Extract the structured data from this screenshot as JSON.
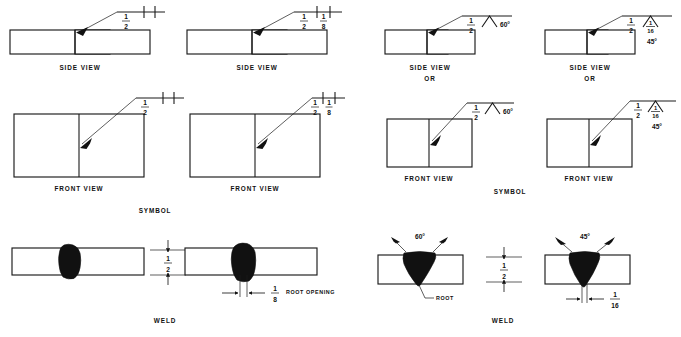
{
  "page": {
    "width": 681,
    "height": 337,
    "background": "#ffffff",
    "ink": "#111111"
  },
  "labels": {
    "side_view": "SIDE VIEW",
    "front_view": "FRONT VIEW",
    "or": "OR",
    "symbol": "SYMBOL",
    "weld": "WELD",
    "root": "ROOT",
    "root_opening": "ROOT OPENING"
  },
  "fractions": {
    "half_num": "1",
    "half_den": "2",
    "eighth_num": "1",
    "eighth_den": "8",
    "sixteenth_num": "1",
    "sixteenth_den": "16"
  },
  "angles": {
    "sixty": "60°",
    "fortyfive": "45°"
  },
  "columns": [
    {
      "id": "col-1",
      "joint_type": "square-groove-no-root-opening",
      "symbol": {
        "size": "1/2",
        "weld_symbol": "square-groove",
        "root_opening": null,
        "groove_angle": null
      },
      "views": [
        "SIDE VIEW",
        "FRONT VIEW"
      ]
    },
    {
      "id": "col-2",
      "joint_type": "square-groove-with-root-opening",
      "symbol": {
        "size": "1/2",
        "weld_symbol": "square-groove",
        "root_opening": "1/8",
        "groove_angle": null
      },
      "views": [
        "SIDE VIEW",
        "FRONT VIEW"
      ]
    },
    {
      "id": "col-3",
      "joint_type": "v-groove-60-degree",
      "symbol": {
        "size": "1/2",
        "weld_symbol": "v-groove",
        "root_opening": null,
        "groove_angle": "60°"
      },
      "views": [
        "SIDE VIEW",
        "OR",
        "FRONT VIEW"
      ]
    },
    {
      "id": "col-4",
      "joint_type": "v-groove-45-degree-with-root-opening",
      "symbol": {
        "size": "1/2",
        "weld_symbol": "v-groove",
        "root_opening": "1/16",
        "groove_angle": "45°"
      },
      "views": [
        "SIDE VIEW",
        "OR",
        "FRONT VIEW"
      ]
    }
  ],
  "weld_sections": [
    {
      "id": "weld-left",
      "caption": "WELD",
      "details": [
        {
          "id": "square-butt-closed",
          "thickness": "1/2",
          "root_opening": null
        },
        {
          "id": "square-butt-open",
          "thickness": "1/2",
          "root_opening": "1/8",
          "root_opening_label": "ROOT OPENING"
        }
      ]
    },
    {
      "id": "weld-right",
      "caption": "WELD",
      "details": [
        {
          "id": "v-groove-60",
          "thickness": "1/2",
          "groove_angle": "60°",
          "root_label": "ROOT"
        },
        {
          "id": "v-groove-45",
          "thickness": "1/2",
          "groove_angle": "45°",
          "root_opening": "1/16"
        }
      ]
    }
  ]
}
